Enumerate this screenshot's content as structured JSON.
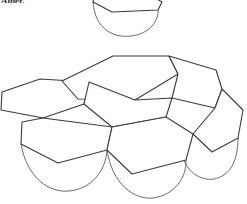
{
  "page": {
    "width": 247,
    "height": 204,
    "background_color": "#ffffff",
    "ink_color": "#3a3a3a",
    "ink_color_light": "#6b6b6b",
    "caption_fragment": "Amer."
  },
  "figure": {
    "hexagon_count": 7,
    "arc_count": 4,
    "stroke_width": 1,
    "stroke_color": "#3a3a3a",
    "fill": "none"
  },
  "chart_data": {
    "type": "diagram",
    "hexagons": [
      {
        "id": "hex-top-partial",
        "label": "top partial hexagon",
        "points": "96,-12 134,-14 162,2 158,10 112,12 93,2"
      },
      {
        "id": "hex-upper-left",
        "label": "upper-left hexagon",
        "points": "62,81 113,56 169,56 178,74 135,100 78,99"
      },
      {
        "id": "hex-upper-right",
        "label": "upper-right hexagon",
        "points": "178,74 169,56 216,70 222,89 215,108 172,98"
      },
      {
        "id": "hex-mid-left",
        "label": "middle-left hexagon",
        "points": "2,92 40,79 89,82 84,104 43,118 1,110"
      },
      {
        "id": "hex-mid-center",
        "label": "middle-center hexagon",
        "points": "84,104 89,82 135,100 172,98 166,117 112,127"
      },
      {
        "id": "hex-lower-left",
        "label": "lower-left hexagon",
        "points": "22,122 43,118 112,127 107,150 58,163 21,144"
      },
      {
        "id": "hex-lower-center",
        "label": "lower-center hexagon",
        "points": "107,150 112,127 166,117 193,134 186,160 132,174"
      },
      {
        "id": "hex-lower-right",
        "label": "lower-right hexagon",
        "points": "193,134 215,108 222,89 243,110 238,138 212,152"
      }
    ],
    "arcs": [
      {
        "id": "arc-top",
        "label": "top pendant arc",
        "path": "M 93,2 C 95,30 114,38 131,36 C 150,34 159,20 158,10"
      },
      {
        "id": "arc-left",
        "label": "left pendant arc",
        "path": "M 21,144 C 27,178 49,193 69,191 C 92,189 106,170 107,150"
      },
      {
        "id": "arc-center",
        "label": "center pendant arc",
        "path": "M 107,150 C 112,184 134,200 153,198 C 175,195 187,177 186,160"
      },
      {
        "id": "arc-right",
        "label": "right pendant arc",
        "path": "M 180,149 C 185,172 200,181 214,179 C 229,176 238,163 238,138"
      }
    ],
    "grid": false,
    "legend": null,
    "xlabel": "",
    "ylabel": ""
  }
}
